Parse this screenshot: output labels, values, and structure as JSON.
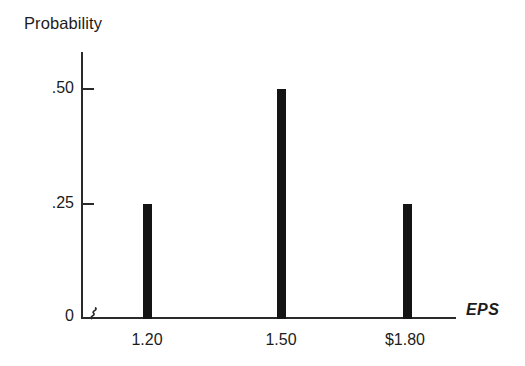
{
  "chart_data": {
    "type": "bar",
    "title": "",
    "subtitle": "",
    "xlabel": "EPS",
    "ylabel": "Probability",
    "categories": [
      "1.20",
      "1.50",
      "$1.80"
    ],
    "x": [
      1.2,
      1.5,
      1.8
    ],
    "values": [
      0.25,
      0.5,
      0.25
    ],
    "ytick_labels": [
      ".25",
      ".50"
    ],
    "ytick_values": [
      0.25,
      0.5
    ],
    "origin_label": "0",
    "ylim": [
      0,
      0.58
    ],
    "grid": false,
    "legend": null,
    "annotations": [
      {
        "name": "x-axis-break",
        "symbol": "squiggle",
        "description": "axis break mark near origin on horizontal axis"
      }
    ],
    "style": {
      "bar_color": "#141414",
      "axis_color": "#2a2a2a",
      "text_color": "#1c1c1c",
      "background": "#ffffff",
      "bar_style": "narrow-spike",
      "xlabel_italic": true
    }
  },
  "axes": {
    "y_title": "Probability",
    "x_title": "EPS",
    "y_ticks": [
      {
        "label": ".50",
        "value": 0.5
      },
      {
        "label": ".25",
        "value": 0.25
      }
    ],
    "origin": "0",
    "x_ticks": [
      {
        "label": "1.20",
        "value": 1.2
      },
      {
        "label": "1.50",
        "value": 1.5
      },
      {
        "label": "$1.80",
        "value": 1.8
      }
    ]
  },
  "bars": [
    {
      "category": "1.20",
      "probability": 0.25,
      "height_px": 115
    },
    {
      "category": "1.50",
      "probability": 0.5,
      "height_px": 231
    },
    {
      "category": "$1.80",
      "probability": 0.25,
      "height_px": 115
    }
  ]
}
